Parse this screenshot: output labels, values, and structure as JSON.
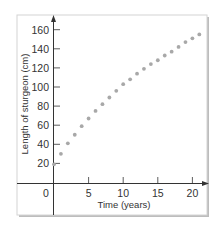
{
  "chart_data": {
    "type": "scatter",
    "title": "",
    "xlabel": "Time (years)",
    "ylabel": "Length of sturgeon (cm)",
    "xlim": [
      0,
      22
    ],
    "ylim": [
      0,
      165
    ],
    "xticks": [
      0,
      5,
      10,
      15,
      20
    ],
    "yticks": [
      20,
      40,
      60,
      80,
      100,
      120,
      140,
      160
    ],
    "grid": false,
    "legend": null,
    "series": [
      {
        "name": "sturgeon length",
        "color": "#a8a8a8",
        "x": [
          0,
          1,
          2,
          3,
          4,
          5,
          6,
          7,
          8,
          9,
          10,
          11,
          12,
          13,
          14,
          15,
          16,
          17,
          18,
          19,
          20,
          21
        ],
        "y": [
          19,
          30,
          41,
          50,
          59,
          67,
          75,
          82,
          89,
          96,
          103,
          108,
          114,
          119,
          124,
          128,
          133,
          137,
          142,
          147,
          151,
          155
        ]
      }
    ]
  },
  "labels": {
    "x_origin": "0",
    "x_ticks": [
      "5",
      "10",
      "15",
      "20"
    ],
    "y_ticks": [
      "20",
      "40",
      "60",
      "80",
      "100",
      "120",
      "140",
      "160"
    ],
    "xlabel": "Time (years)",
    "ylabel": "Length of sturgeon (cm)"
  },
  "colors": {
    "axis": "#333333",
    "points": "#a8a8a8",
    "frame": "#d4d4d4",
    "frame_shadow": "#bdbdbd"
  }
}
